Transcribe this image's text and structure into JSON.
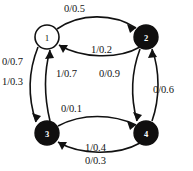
{
  "diagram": {
    "type": "state-transition-diagram",
    "title": "",
    "nodes": [
      {
        "id": "1",
        "label": "1",
        "style": "open",
        "fill": "#ffffff",
        "text_color": "#111111",
        "cx": 47,
        "cy": 37,
        "r": 12
      },
      {
        "id": "2",
        "label": "2",
        "style": "filled",
        "fill": "#100f0f",
        "text_color": "#ffffff",
        "cx": 146,
        "cy": 37,
        "r": 12
      },
      {
        "id": "3",
        "label": "3",
        "style": "filled",
        "fill": "#100f0f",
        "text_color": "#ffffff",
        "cx": 47,
        "cy": 133,
        "r": 12
      },
      {
        "id": "4",
        "label": "4",
        "style": "filled",
        "fill": "#100f0f",
        "text_color": "#ffffff",
        "cx": 146,
        "cy": 133,
        "r": 12
      }
    ],
    "edges": [
      {
        "id": "e1",
        "from": "1",
        "to": "2",
        "input": "0",
        "probability": "0.5",
        "label": "0/0.5",
        "label_x": 64,
        "label_y": 3
      },
      {
        "id": "e2",
        "from": "2",
        "to": "1",
        "input": "1",
        "probability": "0.2",
        "label": "1/0.2",
        "label_x": 91,
        "label_y": 44
      },
      {
        "id": "e3",
        "from": "1",
        "to": "3",
        "input": "0",
        "probability": "0.7",
        "label": "0/0.7",
        "label_x": 2,
        "label_y": 56
      },
      {
        "id": "e4",
        "from": "1",
        "to": "3",
        "input": "1",
        "probability": "0.3",
        "label": "1/0.3",
        "label_x": 2,
        "label_y": 76
      },
      {
        "id": "e5",
        "from": "3",
        "to": "1",
        "input": "1",
        "probability": "0.7",
        "label": "1/0.7",
        "label_x": 56,
        "label_y": 68
      },
      {
        "id": "e6",
        "from": "2",
        "to": "4",
        "input": "0",
        "probability": "0.9",
        "label": "0/0.9",
        "label_x": 99,
        "label_y": 68
      },
      {
        "id": "e7",
        "from": "4",
        "to": "2",
        "input": "0",
        "probability": "0.6",
        "label": "0/0.6",
        "label_x": 153,
        "label_y": 84
      },
      {
        "id": "e8",
        "from": "3",
        "to": "4",
        "input": "0",
        "probability": "0.1",
        "label": "0/0.1",
        "label_x": 61,
        "label_y": 103
      },
      {
        "id": "e9",
        "from": "4",
        "to": "3",
        "input": "1",
        "probability": "0.4",
        "label": "1/0.4",
        "label_x": 85,
        "label_y": 142
      },
      {
        "id": "e10",
        "from": "4",
        "to": "3",
        "input": "0",
        "probability": "0.3",
        "label": "0/0.3",
        "label_x": 85,
        "label_y": 155
      }
    ],
    "colors": {
      "stroke": "#111111",
      "node_fill_active": "#100f0f",
      "node_fill_inactive": "#ffffff",
      "background": "#ffffff"
    }
  }
}
